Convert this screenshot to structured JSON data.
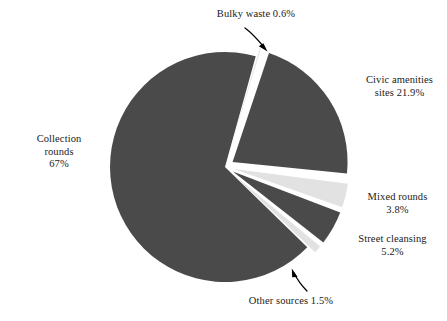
{
  "chart_data": {
    "type": "pie",
    "title": "",
    "subtitle": "",
    "xlabel": "",
    "ylabel": "",
    "legend_position": "none",
    "grid": false,
    "labels_on_slices": false,
    "unit": "%",
    "categories": [
      "Collection rounds",
      "Bulky waste",
      "Civic amenities sites",
      "Mixed rounds",
      "Street cleansing",
      "Other sources"
    ],
    "values": [
      67,
      0.6,
      21.9,
      3.8,
      5.2,
      1.5
    ],
    "slices": [
      {
        "name": "collection-rounds",
        "label": "Collection rounds",
        "value": 67,
        "value_text": "67%",
        "color": "#4a4a4a",
        "exploded": false,
        "label_lines": [
          "Collection",
          "rounds",
          "67%"
        ],
        "leader": "none"
      },
      {
        "name": "bulky-waste",
        "label": "Bulky waste",
        "value": 0.6,
        "value_text": "0.6%",
        "color": "#e2e2e2",
        "exploded": true,
        "label_lines": [
          "Bulky waste 0.6%"
        ],
        "leader": "curved-arrow"
      },
      {
        "name": "civic-amenities-sites",
        "label": "Civic amenities sites",
        "value": 21.9,
        "value_text": "21.9%",
        "color": "#4a4a4a",
        "exploded": true,
        "label_lines": [
          "Civic amenities",
          "sites 21.9%"
        ],
        "leader": "none"
      },
      {
        "name": "mixed-rounds",
        "label": "Mixed rounds",
        "value": 3.8,
        "value_text": "3.8%",
        "color": "#e2e2e2",
        "exploded": true,
        "label_lines": [
          "Mixed rounds",
          "3.8%"
        ],
        "leader": "none"
      },
      {
        "name": "street-cleansing",
        "label": "Street cleansing",
        "value": 5.2,
        "value_text": "5.2%",
        "color": "#4a4a4a",
        "exploded": true,
        "label_lines": [
          "Street cleansing",
          "5.2%"
        ],
        "leader": "none"
      },
      {
        "name": "other-sources",
        "label": "Other sources",
        "value": 1.5,
        "value_text": "1.5%",
        "color": "#e2e2e2",
        "exploded": true,
        "label_lines": [
          "Other sources 1.5%"
        ],
        "leader": "curved-arrow"
      }
    ],
    "colors": {
      "dark_slice": "#4a4a4a",
      "light_slice": "#e2e2e2",
      "background": "#ffffff",
      "text": "#1a1a1a",
      "arrow": "#000000"
    }
  },
  "labels": {
    "bulky_waste": "Bulky waste 0.6%",
    "civic_line1": "Civic amenities",
    "civic_line2": "sites 21.9%",
    "mixed_line1": "Mixed rounds",
    "mixed_line2": "3.8%",
    "street_line1": "Street cleansing",
    "street_line2": "5.2%",
    "other_sources": "Other sources 1.5%",
    "collection_line1": "Collection",
    "collection_line2": "rounds",
    "collection_line3": "67%"
  }
}
